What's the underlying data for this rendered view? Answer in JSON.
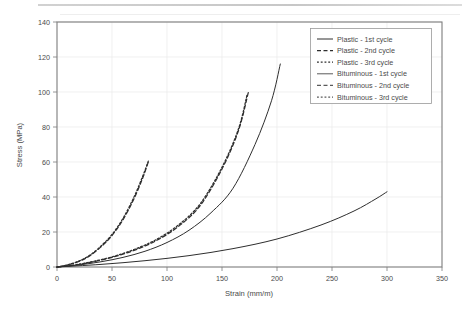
{
  "chart_data": {
    "type": "line",
    "title": "",
    "xlabel": "Strain (mm/m)",
    "ylabel": "Stress (MPa)",
    "xlim": [
      0,
      350
    ],
    "ylim": [
      0,
      140
    ],
    "xticks": [
      0,
      50,
      100,
      150,
      200,
      250,
      300,
      350
    ],
    "yticks": [
      0,
      20,
      40,
      60,
      80,
      100,
      120,
      140
    ],
    "grid": true,
    "legend_position": "top-right",
    "series": [
      {
        "name": "Plastic - 1st cycle",
        "style": "solid",
        "color": "#2e2e2e",
        "x": [
          0,
          20,
          40,
          60,
          80,
          100,
          120,
          140,
          160,
          180,
          195,
          203
        ],
        "y": [
          0,
          1.2,
          3.0,
          5.5,
          9.0,
          14.0,
          21.0,
          31.0,
          45.0,
          70.0,
          95.0,
          116.0
        ]
      },
      {
        "name": "Plastic - 2nd cycle",
        "style": "dashed",
        "color": "#2e2e2e",
        "x": [
          0,
          15,
          30,
          50,
          70,
          90,
          110,
          130,
          150,
          165,
          174
        ],
        "y": [
          0,
          1.0,
          2.6,
          5.5,
          9.5,
          15.0,
          23.0,
          35.0,
          56.0,
          78.0,
          100.0
        ]
      },
      {
        "name": "Plastic - 3rd cycle",
        "style": "dotted",
        "color": "#2e2e2e",
        "x": [
          0,
          15,
          30,
          50,
          70,
          90,
          110,
          130,
          150,
          165,
          173
        ],
        "y": [
          0,
          1.1,
          2.8,
          5.8,
          10.0,
          15.6,
          23.8,
          36.0,
          57.0,
          79.0,
          99.0
        ]
      },
      {
        "name": "Bituminous - 1st cycle",
        "style": "solid",
        "color": "#5a5a5a",
        "x": [
          0,
          40,
          80,
          120,
          160,
          200,
          240,
          270,
          290,
          300
        ],
        "y": [
          0,
          1.5,
          3.6,
          6.5,
          10.5,
          16.0,
          24.0,
          32.0,
          39.0,
          43.0
        ]
      },
      {
        "name": "Bituminous - 2nd cycle",
        "style": "dashed",
        "color": "#6a6a6a",
        "x": [
          0,
          10,
          20,
          30,
          40,
          50,
          60,
          70,
          78,
          83
        ],
        "y": [
          0,
          1.2,
          3.2,
          6.5,
          11.5,
          18.0,
          27.0,
          39.0,
          51.0,
          60.0
        ]
      },
      {
        "name": "Bituminous - 3rd cycle",
        "style": "dotted",
        "color": "#6a6a6a",
        "x": [
          0,
          10,
          20,
          30,
          40,
          50,
          60,
          70,
          78,
          83
        ],
        "y": [
          0,
          1.3,
          3.4,
          6.8,
          12.0,
          18.6,
          27.8,
          40.0,
          52.0,
          60.5
        ]
      }
    ]
  },
  "axes": {
    "y_label": "Stress (MPa)",
    "x_label": "Strain (mm/m)",
    "y_tick_labels": [
      "0",
      "20",
      "40",
      "60",
      "80",
      "100",
      "120",
      "140"
    ],
    "x_tick_labels": [
      "0",
      "50",
      "100",
      "150",
      "200",
      "250",
      "300",
      "350"
    ]
  },
  "legend": {
    "entries": [
      {
        "label": "Plastic - 1st cycle",
        "style": "solid"
      },
      {
        "label": "Plastic - 2nd cycle",
        "style": "dashed"
      },
      {
        "label": "Plastic - 3rd cycle",
        "style": "dotted"
      },
      {
        "label": "Bituminous - 1st cycle",
        "style": "solid"
      },
      {
        "label": "Bituminous - 2nd cycle",
        "style": "dashed"
      },
      {
        "label": "Bituminous - 3rd cycle",
        "style": "dotted"
      }
    ]
  },
  "colors": {
    "curve_dark": "#2e2e2e",
    "curve_light": "#5a5a5a",
    "grid": "#e9e9e9",
    "frame": "#7d7d7d",
    "text": "#4a4a4a",
    "background": "#ffffff"
  }
}
